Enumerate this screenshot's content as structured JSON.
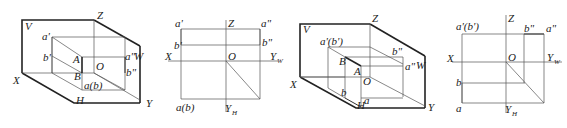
{
  "figures": [
    {
      "id": "fig1-axonometric",
      "type": "axonometric",
      "labels": {
        "V": "V",
        "Z": "Z",
        "X": "X",
        "H": "H",
        "Y": "Y",
        "W": "W",
        "O": "O",
        "a_prime": "a'",
        "b_prime": "b'",
        "A": "A",
        "B": "B",
        "a_dprime": "a\"",
        "b_dprime": "b\"",
        "a_b": "a(b)"
      }
    },
    {
      "id": "fig2-projection",
      "type": "orthographic-projection",
      "labels": {
        "Z": "Z",
        "X": "X",
        "O": "O",
        "Y_W": "Y",
        "Y_W_sub": "W",
        "Y_H": "Y",
        "Y_H_sub": "H",
        "a_prime": "a'",
        "b_prime": "b'",
        "a_dprime": "a\"",
        "b_dprime": "b\"",
        "a_b": "a(b)"
      }
    },
    {
      "id": "fig3-axonometric",
      "type": "axonometric",
      "labels": {
        "V": "V",
        "Z": "Z",
        "X": "X",
        "H": "H",
        "Y": "Y",
        "W": "W",
        "O": "O",
        "a_b_prime": "a'(b')",
        "B": "B",
        "A": "A",
        "b_dprime": "b\"",
        "a_dprime": "a\"",
        "b": "b",
        "a": "a"
      }
    },
    {
      "id": "fig4-projection",
      "type": "orthographic-projection",
      "labels": {
        "Z": "Z",
        "X": "X",
        "O": "O",
        "Y_W": "Y",
        "Y_W_sub": "W",
        "Y_H": "Y",
        "Y_H_sub": "H",
        "a_b_prime": "a'(b')",
        "b_dprime": "b\"",
        "a_dprime": "a\"",
        "b": "b",
        "a": "a"
      }
    }
  ]
}
